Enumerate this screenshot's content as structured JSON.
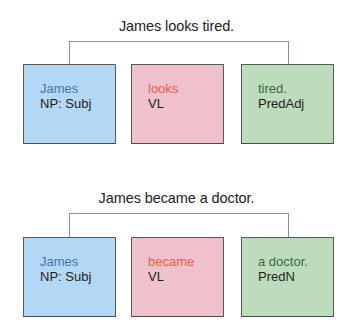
{
  "diagrams": [
    {
      "sentence": "James looks tired.",
      "boxes": [
        {
          "word": "James",
          "role": "NP: Subj",
          "color": "#b3d8f6",
          "word_color": "#4a72aa"
        },
        {
          "word": "looks",
          "role": "VL",
          "color": "#eec1cb",
          "word_color": "#e65e4c"
        },
        {
          "word": "tired.",
          "role": "PredAdj",
          "color": "#bcdcbc",
          "word_color": "#3e6a3e"
        }
      ],
      "connector": {
        "from": "James",
        "to": "tired.",
        "color": "#7e8db0"
      }
    },
    {
      "sentence": "James became a doctor.",
      "boxes": [
        {
          "word": "James",
          "role": "NP: Subj",
          "color": "#b3d8f6",
          "word_color": "#4a72aa"
        },
        {
          "word": "became",
          "role": "VL",
          "color": "#eec1cb",
          "word_color": "#e65e4c"
        },
        {
          "word": "a doctor.",
          "role": "PredN",
          "color": "#bcdcbc",
          "word_color": "#3e6a3e"
        }
      ],
      "connector": {
        "from": "James",
        "to": "a doctor.",
        "color": "#7e8db0"
      }
    }
  ]
}
